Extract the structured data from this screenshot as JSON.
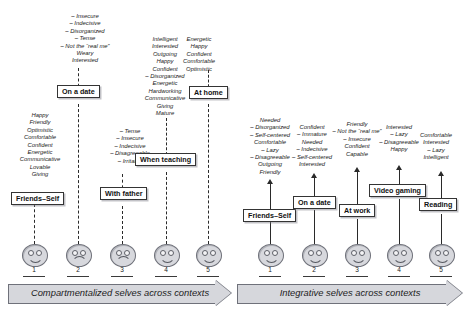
{
  "left_panel": {
    "banner_label": "Compartmentalized selves across contexts",
    "columns": [
      {
        "box_label": "Friends–Self",
        "face_number": "1",
        "face_expression": "smile",
        "attributes": [
          "Happy",
          "Friendly",
          "Optimistic",
          "Comfortable",
          "Confident",
          "Energetic",
          "Communicative",
          "Lovable",
          "Giving"
        ]
      },
      {
        "box_label": "On a date",
        "face_number": "2",
        "face_expression": "frown",
        "attributes": [
          "– Insecure",
          "– Indecisive",
          "– Disorganized",
          "– Tense",
          "– Not the “real me”",
          "Weary",
          "Interested"
        ]
      },
      {
        "box_label": "With father",
        "face_number": "3",
        "face_expression": "frown",
        "attributes": [
          "– Tense",
          "– Insecure",
          "– Indecisive",
          "– Disagreeable",
          "– Irritable"
        ]
      },
      {
        "box_label": "When teaching",
        "face_number": "4",
        "face_expression": "smile",
        "attributes": [
          "Intelligent",
          "Interested",
          "Outgoing",
          "Happy",
          "Confident",
          "– Disorganized",
          "Energetic",
          "Hardworking",
          "Communicative",
          "Giving",
          "Mature"
        ]
      },
      {
        "box_label": "At home",
        "face_number": "5",
        "face_expression": "smile",
        "attributes": [
          "Energetic",
          "Happy",
          "Confident",
          "Comfortable",
          "Optimistic"
        ]
      }
    ]
  },
  "right_panel": {
    "banner_label": "Integrative selves across contexts",
    "columns": [
      {
        "box_label": "Friends–Self",
        "face_number": "1",
        "face_expression": "smile",
        "attributes": [
          "Needed",
          "– Disorganized",
          "– Self-centered",
          "Comfortable",
          "– Lazy",
          "– Disagreeable",
          "Outgoing",
          "Friendly"
        ]
      },
      {
        "box_label": "On a date",
        "face_number": "2",
        "face_expression": "smile",
        "attributes": [
          "Confident",
          "– Immature",
          "Needed",
          "– Indecisive",
          "– Self-centered",
          "Interested"
        ]
      },
      {
        "box_label": "At work",
        "face_number": "3",
        "face_expression": "smile",
        "attributes": [
          "Friendly",
          "– Not the “real me”",
          "– Insecure",
          "Confident",
          "Capable"
        ]
      },
      {
        "box_label": "Video gaming",
        "face_number": "4",
        "face_expression": "smile",
        "attributes": [
          "Interested",
          "– Lazy",
          "– Disagreeable",
          "Happy"
        ]
      },
      {
        "box_label": "Reading",
        "face_number": "5",
        "face_expression": "smile",
        "attributes": [
          "Comfortable",
          "Interested",
          "– Lazy",
          "Intelligent"
        ]
      }
    ]
  },
  "colors": {
    "face_fill": "#d7d8dd",
    "banner_fill": "#d6d7dc",
    "line": "#2a2a2a"
  }
}
